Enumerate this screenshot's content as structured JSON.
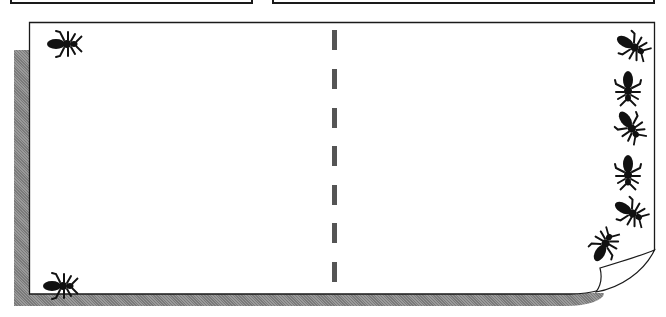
{
  "header": {
    "left_box_label": "",
    "right_box_label": ""
  },
  "page": {
    "background": "#ffffff",
    "border_color": "#1a1a1a",
    "shadow_color": "#888888",
    "divider": "dashed-vertical",
    "curl_corner": "bottom-right"
  },
  "divider": {
    "dash_count": 7,
    "dash_color": "#555555"
  },
  "bugs": [
    {
      "name": "bug-top-left",
      "icon": "ant-icon",
      "x": 44,
      "y": 28,
      "rotate": 0
    },
    {
      "name": "bug-bottom-left",
      "icon": "ant-icon",
      "x": 40,
      "y": 270,
      "rotate": 0
    },
    {
      "name": "bug-right-1",
      "icon": "ant-icon",
      "x": 612,
      "y": 30,
      "rotate": 30
    },
    {
      "name": "bug-right-2",
      "icon": "ant-icon",
      "x": 610,
      "y": 70,
      "rotate": 90
    },
    {
      "name": "bug-right-3",
      "icon": "ant-icon",
      "x": 612,
      "y": 110,
      "rotate": 60
    },
    {
      "name": "bug-right-4",
      "icon": "ant-icon",
      "x": 610,
      "y": 155,
      "rotate": 90
    },
    {
      "name": "bug-right-5",
      "icon": "ant-icon",
      "x": 612,
      "y": 198,
      "rotate": 30
    },
    {
      "name": "bug-right-6",
      "icon": "ant-icon",
      "x": 585,
      "y": 230,
      "rotate": -60
    }
  ]
}
